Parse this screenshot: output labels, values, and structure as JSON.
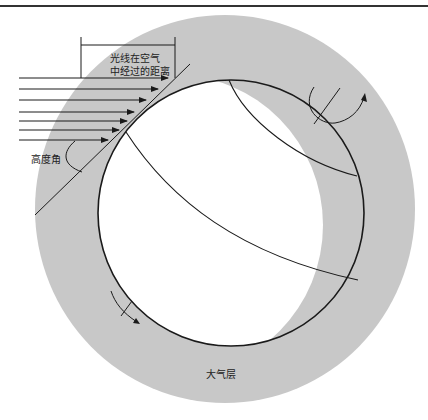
{
  "diagram": {
    "title": "",
    "labels": {
      "path_length": [
        "光线在空气",
        "中经过的距离"
      ],
      "elevation_angle": "高度角",
      "atmosphere": "大气层"
    },
    "colors": {
      "atmosphere_fill": "#c8c8c8",
      "earth_lit": "#ffffff",
      "line": "#1a1a1a"
    },
    "rays": {
      "count": 7,
      "start_x": 19,
      "y": [
        78,
        89,
        100,
        112,
        121,
        130,
        140
      ],
      "end_x": [
        168,
        158,
        146,
        134,
        127,
        119,
        108
      ]
    }
  }
}
